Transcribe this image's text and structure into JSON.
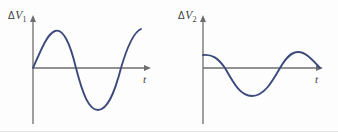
{
  "figure": {
    "background_color": "#fdfdfd",
    "curve_color": "#3c4a7c",
    "axis_color": "#6e6e6e",
    "label_color": "#3a3a3a"
  },
  "charts": [
    {
      "id": "chart-left",
      "y_axis_label_delta": "Δ",
      "y_axis_label_var": "V",
      "y_axis_label_sub": "1",
      "x_axis_label": "t",
      "origin": {
        "x": 33,
        "y": 68
      },
      "x_axis_end": {
        "x": 150,
        "y": 68
      },
      "y_axis_top": {
        "x": 33,
        "y": 18
      },
      "y_axis_bottom": {
        "x": 33,
        "y": 124
      },
      "path": "M33,68 C41,50 47,34 55,31 C63,28 70,43 76,68 C83,95 89,110 98,110 C107,110 114,95 121,68 C128,44 134,32 141,29"
    },
    {
      "id": "chart-right",
      "y_axis_label_delta": "Δ",
      "y_axis_label_var": "V",
      "y_axis_label_sub": "2",
      "x_axis_label": "t",
      "origin": {
        "x": 203,
        "y": 68
      },
      "x_axis_end": {
        "x": 322,
        "y": 68
      },
      "y_axis_top": {
        "x": 203,
        "y": 18
      },
      "y_axis_bottom": {
        "x": 203,
        "y": 124
      },
      "path": "M203,55 C212,54 218,58 225,68 C233,82 240,96 252,96 C264,96 272,82 280,68 C287,56 292,52 298,52 C305,52 311,58 320,68"
    }
  ],
  "chart_data": {
    "type": "line",
    "title": "",
    "xlabel": "t",
    "ylabel": "ΔV",
    "grid": false,
    "legend": "none",
    "axis_ranges": {
      "x": [
        0,
        1
      ],
      "y": [
        -1.1,
        1.1
      ]
    },
    "series": [
      {
        "name": "ΔV1",
        "description": "Sine wave starting at zero, rising to a positive peak, crossing zero, dipping to a deeper negative trough, then rising back up",
        "waveform": "sine",
        "phase_deg": 0,
        "amplitude": 1.0,
        "cycles_shown": 1.25,
        "x": [
          0.0,
          0.08,
          0.19,
          0.25,
          0.31,
          0.37,
          0.44,
          0.5,
          0.56,
          0.62,
          0.69,
          0.75,
          0.81,
          0.87,
          0.92,
          1.0
        ],
        "y": [
          0.0,
          0.55,
          0.95,
          1.0,
          0.93,
          0.7,
          0.35,
          0.0,
          -0.4,
          -0.75,
          -0.97,
          -1.0,
          -0.9,
          -0.6,
          -0.3,
          0.88
        ]
      },
      {
        "name": "ΔV2",
        "description": "Cosine-like wave starting at a positive value below the first peak, falling through zero to a negative trough, rising to a second positive peak, then descending to zero at the right end",
        "waveform": "cosine",
        "phase_deg": 90,
        "amplitude": 0.55,
        "cycles_shown": 1.0,
        "x": [
          0.0,
          0.09,
          0.19,
          0.28,
          0.37,
          0.42,
          0.5,
          0.58,
          0.65,
          0.72,
          0.81,
          0.9,
          1.0
        ],
        "y": [
          0.27,
          0.24,
          0.12,
          -0.1,
          -0.38,
          -0.5,
          -0.58,
          -0.48,
          -0.25,
          0.05,
          0.32,
          0.33,
          0.0
        ]
      }
    ]
  }
}
